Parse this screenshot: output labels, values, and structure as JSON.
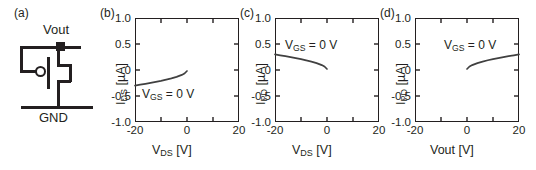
{
  "figure": {
    "panels": [
      {
        "label": "(a)",
        "type": "circuit"
      },
      {
        "label": "(b)",
        "type": "plot"
      },
      {
        "label": "(c)",
        "type": "plot"
      },
      {
        "label": "(d)",
        "type": "plot"
      }
    ]
  },
  "circuit": {
    "label": "(a)",
    "node_label": "Vout",
    "ground_label": "GND",
    "device": "p-channel MOSFET, diode-connected via gate feedback",
    "gate_marker": "inversion-bubble"
  },
  "chart_data": [
    {
      "panel": "(b)",
      "type": "line",
      "title": "",
      "xlabel": "V_DS [V]",
      "xlabel_main": "V",
      "xlabel_sub": "DS",
      "xlabel_unit": " [V]",
      "ylabel": "I_DS [µA]",
      "ylabel_main": "I",
      "ylabel_sub": "DS",
      "ylabel_unit": " [µA]",
      "xlim": [
        -20,
        20
      ],
      "ylim": [
        -1.0,
        1.0
      ],
      "xticks": [
        -20,
        0,
        20
      ],
      "xtick_labels": [
        "-20",
        "0",
        "20"
      ],
      "yticks": [
        1.0,
        0.5,
        0,
        -0.5,
        -1.0
      ],
      "ytick_labels": [
        "1.0",
        "0.5",
        "0",
        "-0.5",
        "-1.0"
      ],
      "grid": false,
      "annotation": "V_GS = 0 V",
      "annotation_main": "V",
      "annotation_sub": "GS",
      "annotation_rest": " = 0 V",
      "series": [
        {
          "name": "I_DS",
          "x": [
            -20,
            -18,
            -16,
            -14,
            -12,
            -10,
            -8,
            -6,
            -4,
            -2,
            -1,
            0
          ],
          "y": [
            -0.3,
            -0.283,
            -0.266,
            -0.248,
            -0.229,
            -0.209,
            -0.187,
            -0.162,
            -0.133,
            -0.095,
            -0.068,
            -0.02
          ]
        }
      ]
    },
    {
      "panel": "(c)",
      "type": "line",
      "title": "",
      "xlabel": "V_DS [V]",
      "xlabel_main": "V",
      "xlabel_sub": "DS",
      "xlabel_unit": " [V]",
      "ylabel": "I_PD [µA]",
      "ylabel_main": "I",
      "ylabel_sub": "PD",
      "ylabel_unit": " [µA]",
      "xlim": [
        -20,
        20
      ],
      "ylim": [
        -1.0,
        1.0
      ],
      "xticks": [
        -20,
        0,
        20
      ],
      "xtick_labels": [
        "-20",
        "0",
        "20"
      ],
      "yticks": [
        1.0,
        0.5,
        0,
        -0.5,
        -1.0
      ],
      "ytick_labels": [
        "1.0",
        "0.5",
        "0",
        "-0.5",
        "-1.0"
      ],
      "grid": false,
      "annotation": "V_GS = 0 V",
      "annotation_main": "V",
      "annotation_sub": "GS",
      "annotation_rest": " = 0 V",
      "series": [
        {
          "name": "I_PD",
          "x": [
            -20,
            -18,
            -16,
            -14,
            -12,
            -10,
            -8,
            -6,
            -4,
            -2,
            -1,
            0
          ],
          "y": [
            0.3,
            0.283,
            0.266,
            0.248,
            0.229,
            0.209,
            0.187,
            0.162,
            0.133,
            0.095,
            0.068,
            0.02
          ]
        }
      ]
    },
    {
      "panel": "(d)",
      "type": "line",
      "title": "",
      "xlabel": "Vout [V]",
      "xlabel_main": "Vout",
      "xlabel_sub": "",
      "xlabel_unit": " [V]",
      "ylabel": "I_PD [µA]",
      "ylabel_main": "I",
      "ylabel_sub": "PD",
      "ylabel_unit": " [µA]",
      "xlim": [
        -20,
        20
      ],
      "ylim": [
        -1.0,
        1.0
      ],
      "xticks": [
        -20,
        0,
        20
      ],
      "xtick_labels": [
        "-20",
        "0",
        "20"
      ],
      "yticks": [
        1.0,
        0.5,
        0,
        -0.5,
        -1.0
      ],
      "ytick_labels": [
        "1.0",
        "0.5",
        "0",
        "-0.5",
        "-1.0"
      ],
      "grid": false,
      "annotation": "V_GS = 0 V",
      "annotation_main": "V",
      "annotation_sub": "GS",
      "annotation_rest": " = 0 V",
      "series": [
        {
          "name": "I_PD",
          "x": [
            0,
            1,
            2,
            4,
            6,
            8,
            10,
            12,
            14,
            16,
            18,
            20
          ],
          "y": [
            0.02,
            0.068,
            0.095,
            0.133,
            0.162,
            0.187,
            0.209,
            0.229,
            0.248,
            0.266,
            0.283,
            0.3
          ]
        }
      ]
    }
  ],
  "style": {
    "line_color": "#404040",
    "axis_color": "#231f20",
    "background": "#ffffff"
  }
}
